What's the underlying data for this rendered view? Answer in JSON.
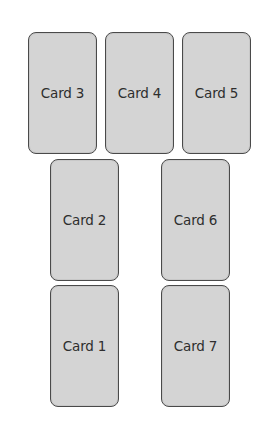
{
  "diagram": {
    "colors": {
      "card_fill": "#d4d4d4",
      "card_border": "#4a4a4a",
      "text": "#2e2e2e",
      "background": "#ffffff"
    },
    "rows": [
      {
        "cards": [
          {
            "id": "card-3",
            "label": "Card 3"
          },
          {
            "id": "card-4",
            "label": "Card 4"
          },
          {
            "id": "card-5",
            "label": "Card 5"
          }
        ]
      },
      {
        "cards": [
          {
            "id": "card-2",
            "label": "Card 2"
          },
          {
            "id": "card-6",
            "label": "Card 6"
          }
        ]
      },
      {
        "cards": [
          {
            "id": "card-1",
            "label": "Card 1"
          },
          {
            "id": "card-7",
            "label": "Card 7"
          }
        ]
      }
    ]
  }
}
